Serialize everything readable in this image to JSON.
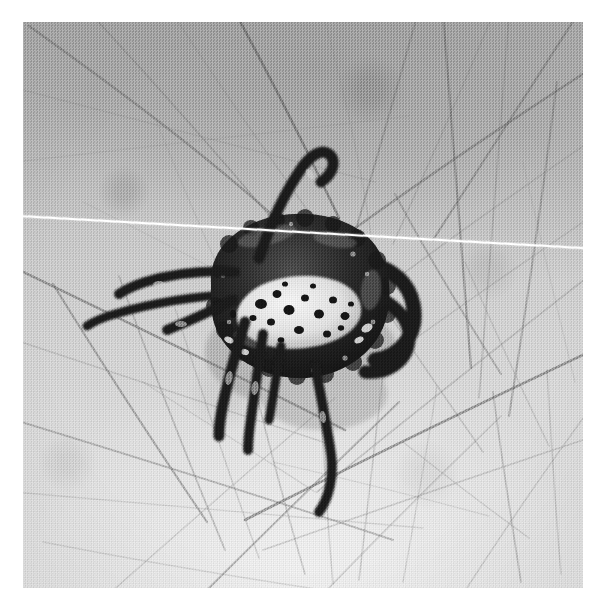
{
  "image": {
    "kind": "photograph",
    "medium": "black-and-white halftone print",
    "caption": "Close-up photograph of a tick attached to hairy human skin",
    "subject": "tick",
    "background_subject": "human skin with body hair",
    "width_px": 615,
    "height_px": 602,
    "orientation": "square",
    "colors": {
      "page_background": "#ffffff",
      "skin_light": "#e4e4e4",
      "skin_mid": "#c8c8c8",
      "skin_dark": "#a9a9a9",
      "hair_dark": "#4a4a4a",
      "hair_mid": "#7d7d7d",
      "hair_faint": "#a0a0a0",
      "tick_body": "#232323",
      "tick_body_highlight": "#5e5e5e",
      "tick_scutum": "#f2efe6",
      "tick_scutum_speckle": "#1c1c1c",
      "scratch_white": "#ffffff"
    }
  },
  "print": {
    "left": 23,
    "top": 22,
    "width": 560,
    "height": 566,
    "border_label": "white photographic margin"
  },
  "defect": {
    "name": "emulsion scratch",
    "description": "thin white diagonal line crossing the full width of the print",
    "start_x": 23,
    "start_y": 215,
    "end_x": 583,
    "end_y": 247
  },
  "tick": {
    "common_name": "tick",
    "position": {
      "center_x": 288,
      "center_y": 296
    },
    "body": {
      "label": "idiosoma",
      "description": "dark rounded engorging body, roughly oval, tilted",
      "fill": "#232323"
    },
    "scutum": {
      "label": "scutum",
      "description": "pale cream shield with dark speckles on the dorsal surface",
      "fill": "#f2efe6",
      "speckle_count": 18
    },
    "legs": {
      "count": 8,
      "description": "dark jointed legs radiating left, down and right; one foreleg raised and hooked upward"
    },
    "raised_foreleg": {
      "description": "front leg lifted above the body, curving up and hooking to the right"
    }
  },
  "hairs": {
    "count": 46,
    "description": "many fine dark body hairs crossing the frame at varied angles, denser toward the lower half",
    "strands": [
      {
        "d": "M 6 4 C 90 64, 186 134, 268 210",
        "w": 2.3,
        "o": 0.55,
        "c": "#6f6f6f"
      },
      {
        "d": "M 70 -6 C 140 70, 212 152, 282 236",
        "w": 1.7,
        "o": 0.42,
        "c": "#7d7d7d"
      },
      {
        "d": "M 150 -8 C 206 78, 268 166, 330 252",
        "w": 1.5,
        "o": 0.34,
        "c": "#8a8a8a"
      },
      {
        "d": "M 212 -10 C 250 60, 286 132, 316 196",
        "w": 2.6,
        "o": 0.6,
        "c": "#5e5e5e"
      },
      {
        "d": "M 300 -8 C 322 72, 340 150, 350 228",
        "w": 1.4,
        "o": 0.3,
        "c": "#909090"
      },
      {
        "d": "M 394 -6 C 372 74, 348 156, 324 238",
        "w": 2.0,
        "o": 0.45,
        "c": "#747474"
      },
      {
        "d": "M 470 -8 C 438 70, 404 146, 370 222",
        "w": 1.6,
        "o": 0.36,
        "c": "#848484"
      },
      {
        "d": "M 556 -10 C 508 66, 458 142, 410 218",
        "w": 2.2,
        "o": 0.5,
        "c": "#6b6b6b"
      },
      {
        "d": "M -8 66 C 108 96, 230 128, 352 160",
        "w": 1.5,
        "o": 0.32,
        "c": "#8d8d8d"
      },
      {
        "d": "M -8 140 C 120 126, 254 110, 386 94",
        "w": 1.3,
        "o": 0.28,
        "c": "#949494"
      },
      {
        "d": "M 566 48 C 470 110, 372 176, 280 244",
        "w": 2.4,
        "o": 0.52,
        "c": "#676767"
      },
      {
        "d": "M 566 120 C 496 168, 424 218, 356 270",
        "w": 1.6,
        "o": 0.34,
        "c": "#888888"
      },
      {
        "d": "M 566 196 C 510 234, 452 274, 396 314",
        "w": 1.5,
        "o": 0.32,
        "c": "#8c8c8c"
      },
      {
        "d": "M 420 -8 C 430 110, 438 228, 448 346",
        "w": 2.3,
        "o": 0.52,
        "c": "#6a6a6a"
      },
      {
        "d": "M 486 -6 C 476 120, 466 248, 456 376",
        "w": 1.7,
        "o": 0.38,
        "c": "#828282"
      },
      {
        "d": "M 534 60 C 520 170, 504 282, 486 394",
        "w": 2.1,
        "o": 0.46,
        "c": "#737373"
      },
      {
        "d": "M 372 172 C 404 232, 440 292, 478 352",
        "w": 2.0,
        "o": 0.44,
        "c": "#757575"
      },
      {
        "d": "M 330 236 C 370 300, 414 364, 460 430",
        "w": 1.6,
        "o": 0.34,
        "c": "#878787"
      },
      {
        "d": "M -8 246 C 100 298, 212 352, 322 408",
        "w": 2.5,
        "o": 0.56,
        "c": "#636363"
      },
      {
        "d": "M -8 318 C 96 352, 204 388, 312 424",
        "w": 1.5,
        "o": 0.32,
        "c": "#8c8c8c"
      },
      {
        "d": "M 30 262 C 78 340, 130 420, 184 500",
        "w": 2.2,
        "o": 0.5,
        "c": "#6c6c6c"
      },
      {
        "d": "M 96 254 C 128 344, 164 436, 202 528",
        "w": 1.8,
        "o": 0.4,
        "c": "#7c7c7c"
      },
      {
        "d": "M 152 286 C 178 368, 206 452, 236 536",
        "w": 1.5,
        "o": 0.32,
        "c": "#8b8b8b"
      },
      {
        "d": "M 228 350 C 244 416, 262 484, 282 552",
        "w": 1.7,
        "o": 0.36,
        "c": "#848484"
      },
      {
        "d": "M 296 358 C 300 426, 304 494, 310 562",
        "w": 1.5,
        "o": 0.32,
        "c": "#8d8d8d"
      },
      {
        "d": "M 360 352 C 352 420, 344 488, 336 558",
        "w": 1.6,
        "o": 0.34,
        "c": "#888888"
      },
      {
        "d": "M 414 364 C 404 428, 392 494, 380 560",
        "w": 1.4,
        "o": 0.3,
        "c": "#929292"
      },
      {
        "d": "M 470 370 C 478 432, 488 496, 498 560",
        "w": 1.8,
        "o": 0.38,
        "c": "#7e7e7e"
      },
      {
        "d": "M 524 348 C 528 414, 532 482, 538 552",
        "w": 1.5,
        "o": 0.32,
        "c": "#8a8a8a"
      },
      {
        "d": "M -8 398 C 116 436, 244 476, 370 518",
        "w": 2.0,
        "o": 0.44,
        "c": "#757575"
      },
      {
        "d": "M -8 470 C 126 482, 264 494, 400 506",
        "w": 1.4,
        "o": 0.28,
        "c": "#959595"
      },
      {
        "d": "M 566 330 C 452 384, 336 440, 222 498",
        "w": 2.6,
        "o": 0.58,
        "c": "#5f5f5f"
      },
      {
        "d": "M 566 416 C 458 452, 348 490, 240 528",
        "w": 1.6,
        "o": 0.34,
        "c": "#898989"
      },
      {
        "d": "M 566 254 C 476 324, 384 396, 294 470",
        "w": 1.7,
        "o": 0.36,
        "c": "#858585"
      },
      {
        "d": "M 180 572 C 244 508, 310 444, 376 380",
        "w": 2.1,
        "o": 0.46,
        "c": "#717171"
      },
      {
        "d": "M 86 572 C 160 506, 236 440, 312 376",
        "w": 1.5,
        "o": 0.3,
        "c": "#8f8f8f"
      },
      {
        "d": "M 300 572 C 358 512, 418 452, 478 394",
        "w": 1.6,
        "o": 0.34,
        "c": "#878787"
      },
      {
        "d": "M 440 572 C 480 510, 522 448, 566 388",
        "w": 1.5,
        "o": 0.32,
        "c": "#8c8c8c"
      },
      {
        "d": "M 20 520 C 112 538, 206 554, 300 568",
        "w": 1.4,
        "o": 0.28,
        "c": "#949494"
      },
      {
        "d": "M 250 440 C 320 456, 392 474, 466 494",
        "w": 1.3,
        "o": 0.26,
        "c": "#999999"
      },
      {
        "d": "M 60 180 C 128 214, 198 250, 268 288",
        "w": 1.3,
        "o": 0.26,
        "c": "#9a9a9a"
      },
      {
        "d": "M 132 96 C 158 160, 186 226, 216 292",
        "w": 1.4,
        "o": 0.28,
        "c": "#969696"
      },
      {
        "d": "M 500 140 C 516 212, 534 286, 552 360",
        "w": 1.3,
        "o": 0.26,
        "c": "#9b9b9b"
      },
      {
        "d": "M 380 420 C 420 452, 462 484, 506 516",
        "w": 1.5,
        "o": 0.3,
        "c": "#909090"
      },
      {
        "d": "M 120 360 C 176 396, 234 432, 292 470",
        "w": 1.4,
        "o": 0.28,
        "c": "#959595"
      },
      {
        "d": "M 442 240 C 468 300, 496 362, 526 424",
        "w": 1.5,
        "o": 0.32,
        "c": "#8e8e8e"
      }
    ]
  }
}
